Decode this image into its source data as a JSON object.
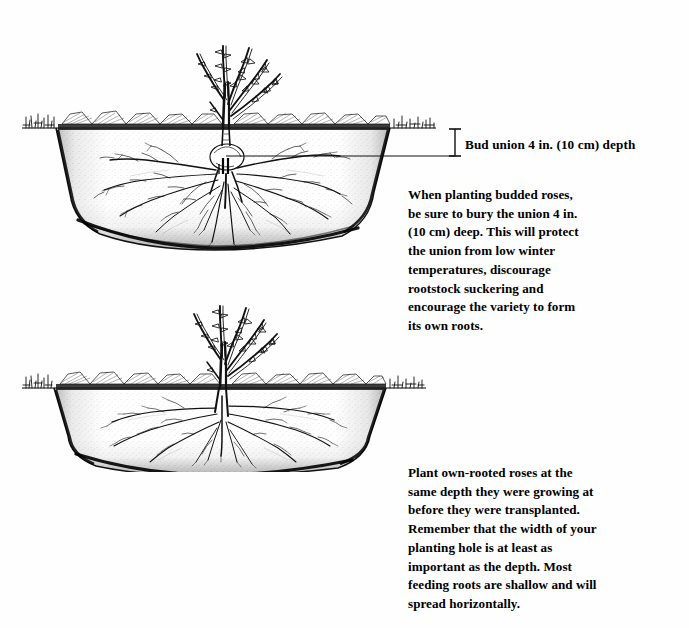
{
  "page": {
    "background_color": "#ffffff",
    "ink_color": "#000000",
    "width": 689,
    "height": 628
  },
  "figures": [
    {
      "id": "budded-rose",
      "name": "budded-rose-planting-diagram",
      "description": "Cross-section pen-and-ink illustration of a budded rose bush planted in a wide saucer-shaped hole, with the bud union buried below the soil line.",
      "parts": {
        "canes": "thorned rose canes above ground",
        "soil_line": "ground surface with grass hatching and clods",
        "hole": "wide shallow planting hole in cross section",
        "bud_union": "swollen graft knob below soil level",
        "roots": "spreading fibrous root system"
      }
    },
    {
      "id": "ownroot-rose",
      "name": "own-rooted-rose-planting-diagram",
      "description": "Cross-section pen-and-ink illustration of an own-rooted rose bush planted at the same depth it was growing, crown at soil level.",
      "parts": {
        "canes": "thorned rose canes above ground",
        "soil_line": "ground surface with grass hatching and clods",
        "hole": "wide shallow planting hole in cross section",
        "crown": "crown at soil level",
        "roots": "spreading fibrous root system"
      }
    }
  ],
  "annotations": {
    "bud_union": {
      "label": "Bud union 4 in. (10 cm) depth",
      "leader_line": "horizontal leader from bud union to vertical depth bracket",
      "bracket": "vertical depth bracket between soil line and bud union"
    }
  },
  "captions": {
    "budded_rose": {
      "lines": [
        "When planting budded roses,",
        "be sure to bury the union 4 in.",
        "(10 cm) deep. This will protect",
        "the union from low winter",
        "temperatures, discourage",
        "rootstock suckering and",
        "encourage the variety to form",
        "its own roots."
      ]
    },
    "own_rooted_rose": {
      "lines": [
        "Plant own-rooted roses at the",
        "same depth they were growing at",
        "before they were transplanted.",
        "Remember that the width of your",
        "planting hole is at least as",
        "important as the depth. Most",
        "feeding roots are shallow and will",
        "spread horizontally."
      ]
    }
  }
}
